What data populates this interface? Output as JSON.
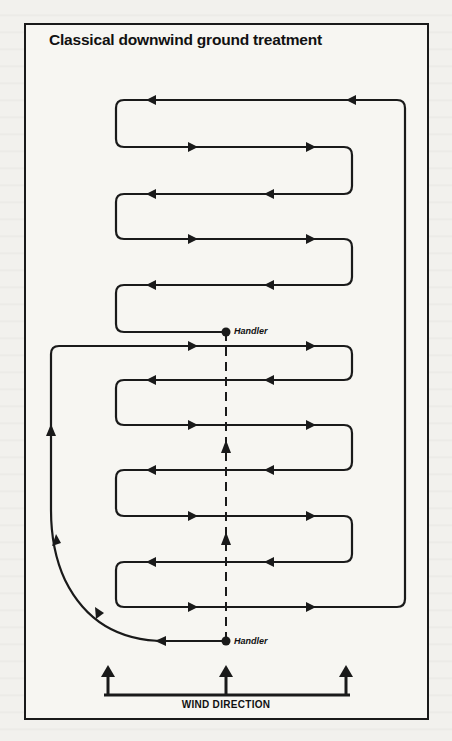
{
  "figure": {
    "title": "Classical downwind ground treatment",
    "labels": {
      "handler_top": "Handler",
      "handler_bottom": "Handler",
      "wind_direction": "WIND DIRECTION"
    },
    "colors": {
      "ink": "#1a1a1a",
      "paper": "#f7f6f2"
    },
    "elements": {
      "spray_path": "serpentine flight lines with direction arrows",
      "handler_markers": 2,
      "wind_arrows": 3,
      "center_line": "dashed vertical line with upward arrows between handlers"
    }
  }
}
